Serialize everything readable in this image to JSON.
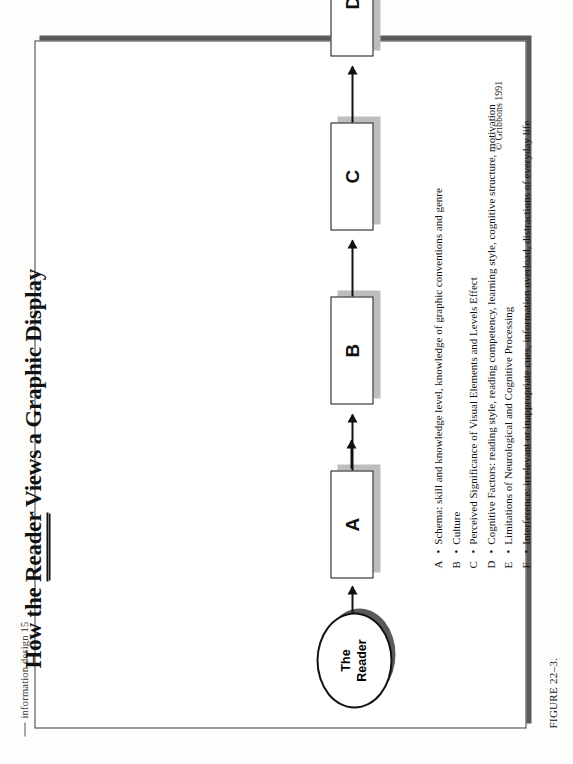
{
  "page": {
    "running_head": "information design  15",
    "figure_caption": "FIGURE 22–3.",
    "copyright": "© Gribbons 1991"
  },
  "figure": {
    "title_prefix": "How the ",
    "title_underlined": "Reader",
    "title_suffix": " Views a Graphic Display",
    "title_full": "How the Reader Views a Graphic Display",
    "source_node": {
      "line1": "The",
      "line2": "Reader"
    },
    "process_boxes": [
      {
        "id": "A",
        "label": "A"
      },
      {
        "id": "B",
        "label": "B"
      },
      {
        "id": "C",
        "label": "C"
      },
      {
        "id": "D",
        "label": "D"
      },
      {
        "id": "E",
        "label": "E"
      },
      {
        "id": "F",
        "label": "F"
      }
    ],
    "output_node": {
      "label": "Display"
    },
    "legend": [
      {
        "key": "A",
        "sep": "•",
        "text": "Schema: skill and knowledge level, knowledge of graphic conventions and genre"
      },
      {
        "key": "B",
        "sep": "•",
        "text": "Culture"
      },
      {
        "key": "C",
        "sep": "•",
        "text": "Perceived Significance of Visual Elements and Levels Effect"
      },
      {
        "key": "D",
        "sep": "•",
        "text": "Cognitive Factors: reading style, reading competency, learning style, cognitive structure, motivation"
      },
      {
        "key": "E",
        "sep": "•",
        "text": "Limitations of Neurological and Cognitive Processing"
      },
      {
        "key": "F",
        "sep": "•",
        "text": "Interference: irrelevant or inappropriate cues, information overload, distractions of everyday life"
      }
    ]
  },
  "colors": {
    "ink": "#111111",
    "shadow_dark": "#575757",
    "shadow_light": "#bdbdbd",
    "paper": "#fdfdfb"
  }
}
